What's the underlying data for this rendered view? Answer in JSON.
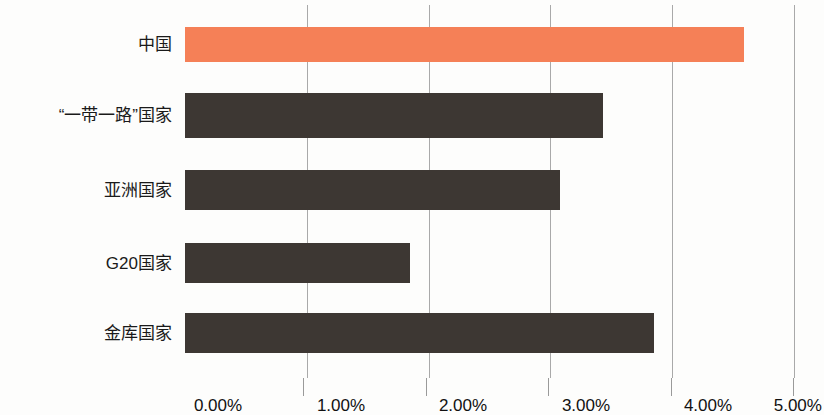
{
  "chart_data": {
    "type": "bar",
    "orientation": "horizontal",
    "title": "",
    "subtitle": "",
    "xlabel": "",
    "ylabel": "",
    "xlim": [
      0,
      5
    ],
    "xtick_labels": [
      "0.00%",
      "1.00%",
      "2.00%",
      "3.00%",
      "4.00%",
      "5.00%"
    ],
    "xticks": [
      0,
      1,
      2,
      3,
      4,
      5
    ],
    "grid": true,
    "grid_axis": "x",
    "legend": false,
    "legend_position": "none",
    "categories": [
      "中国",
      "“一带一路”国家",
      "亚洲国家",
      "G20国家",
      "金库国家"
    ],
    "values": [
      4.59,
      3.43,
      3.08,
      1.85,
      3.85
    ],
    "value_unit": "%",
    "series": [
      {
        "name": "",
        "values": [
          4.59,
          3.43,
          3.08,
          1.85,
          3.85
        ]
      }
    ],
    "bars": [
      {
        "label": "中国",
        "value": 4.59,
        "color": "#f58057",
        "highlight": true
      },
      {
        "label": "“一带一路”国家",
        "value": 3.43,
        "color": "#3d3733",
        "highlight": false
      },
      {
        "label": "亚洲国家",
        "value": 3.08,
        "color": "#3d3733",
        "highlight": false
      },
      {
        "label": "G20国家",
        "value": 1.85,
        "color": "#3d3733",
        "highlight": false
      },
      {
        "label": "金库国家",
        "value": 3.85,
        "color": "#3d3733",
        "highlight": false
      }
    ],
    "colors": {
      "highlight_bar": "#f58057",
      "default_bar": "#3d3733",
      "gridline": "#a9a9a9",
      "text": "#1a1a1a",
      "background": "#fdfdfc"
    }
  }
}
